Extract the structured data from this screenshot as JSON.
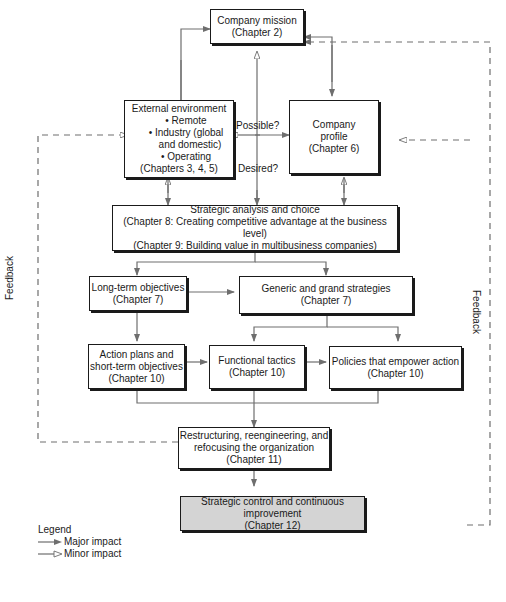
{
  "diagram": {
    "nodes": {
      "mission": {
        "title": "Company mission",
        "chapter": "(Chapter 2)"
      },
      "external": {
        "title": "External environment",
        "bullets": [
          "• Remote",
          "• Industry (global",
          "and domestic)",
          "• Operating"
        ],
        "chapter": "(Chapters 3, 4, 5)"
      },
      "profile": {
        "title": "Company",
        "title2": "profile",
        "chapter": "(Chapter 6)"
      },
      "analysis": {
        "title": "Strategic analysis and choice",
        "line2": "(Chapter 8: Creating competitive advantage at the business level)",
        "line3": "(Chapter 9: Building value in multibusiness companies)"
      },
      "longterm": {
        "title": "Long-term objectives",
        "chapter": "(Chapter 7)"
      },
      "generic": {
        "title": "Generic and grand strategies",
        "chapter": "(Chapter 7)"
      },
      "action": {
        "title": "Action plans and",
        "title2": "short-term objectives",
        "chapter": "(Chapter 10)"
      },
      "functional": {
        "title": "Functional tactics",
        "chapter": "(Chapter 10)"
      },
      "policies": {
        "title": "Policies that empower action",
        "chapter": "(Chapter 10)"
      },
      "restructuring": {
        "title": "Restructuring, reengineering, and",
        "title2": "refocusing the organization",
        "chapter": "(Chapter 11)"
      },
      "control": {
        "title": "Strategic control and continuous improvement",
        "chapter": "(Chapter 12)"
      }
    },
    "edge_labels": {
      "possible": "Possible?",
      "desired": "Desired?",
      "feedback_left": "Feedback",
      "feedback_right": "Feedback"
    },
    "legend": {
      "title": "Legend",
      "major": "Major impact",
      "minor": "Minor impact"
    },
    "colors": {
      "line": "#6e6e6e",
      "box_border": "#1a1a1a",
      "shaded": "#d4d4d4"
    }
  }
}
